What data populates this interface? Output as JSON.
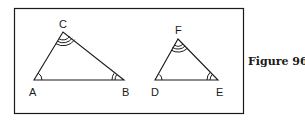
{
  "figure": {
    "caption": "Figure 96",
    "triangles": [
      {
        "name": "ABC",
        "vertices": {
          "A": {
            "label": "A",
            "x": 34,
            "y": 80,
            "angle_marks": 1
          },
          "B": {
            "label": "B",
            "x": 124,
            "y": 80,
            "angle_marks": 2
          },
          "C": {
            "label": "C",
            "x": 63,
            "y": 32,
            "angle_marks": 3
          }
        }
      },
      {
        "name": "DEF",
        "vertices": {
          "D": {
            "label": "D",
            "x": 155,
            "y": 80,
            "angle_marks": 1
          },
          "E": {
            "label": "E",
            "x": 218,
            "y": 80,
            "angle_marks": 2
          },
          "F": {
            "label": "F",
            "x": 178,
            "y": 39,
            "angle_marks": 3
          }
        }
      }
    ],
    "colors": {
      "stroke": "#1a1a1a",
      "background": "#ffffff"
    }
  }
}
